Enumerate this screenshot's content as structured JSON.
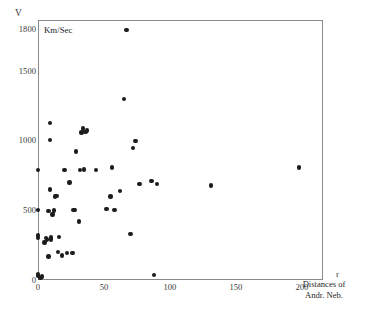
{
  "figure": {
    "unit_label": "Km/Sec",
    "y_axis_symbol": "V",
    "x_axis_symbol": "r",
    "x_caption_line1": "Distances of",
    "x_caption_line2": "Andr. Neb.",
    "frame_color": "#8a8a8a",
    "point_color": "#1c1c1c"
  },
  "chart_data": {
    "type": "scatter",
    "title": "",
    "xlabel": "r  (Distances of Andr. Neb.)",
    "ylabel": "V  (Km/Sec)",
    "xlim": [
      0,
      216
    ],
    "ylim": [
      0,
      1870
    ],
    "grid": false,
    "legend": null,
    "xticks": [
      0,
      50,
      100,
      150,
      200
    ],
    "xtick_labels": [
      "0",
      "50",
      "100",
      "150",
      "200"
    ],
    "yticks": [
      0,
      500,
      1000,
      1500,
      1800
    ],
    "ytick_labels": [
      "0",
      "500",
      "1000",
      "1500",
      "1800"
    ],
    "series": [
      {
        "name": "galaxies",
        "marker": "filled-circle",
        "points": [
          [
            0,
            30
          ],
          [
            0,
            40
          ],
          [
            0,
            300
          ],
          [
            0,
            320
          ],
          [
            0,
            505
          ],
          [
            0,
            790
          ],
          [
            2,
            15
          ],
          [
            3,
            25
          ],
          [
            5,
            270
          ],
          [
            6,
            300
          ],
          [
            7,
            290
          ],
          [
            8,
            170
          ],
          [
            8,
            495
          ],
          [
            9,
            1005
          ],
          [
            9,
            1130
          ],
          [
            9,
            650
          ],
          [
            10,
            305
          ],
          [
            10,
            290
          ],
          [
            11,
            470
          ],
          [
            12,
            500
          ],
          [
            13,
            600
          ],
          [
            14,
            605
          ],
          [
            15,
            200
          ],
          [
            16,
            310
          ],
          [
            18,
            175
          ],
          [
            20,
            790
          ],
          [
            22,
            195
          ],
          [
            24,
            700
          ],
          [
            26,
            195
          ],
          [
            27,
            505
          ],
          [
            28,
            505
          ],
          [
            29,
            925
          ],
          [
            31,
            420
          ],
          [
            32,
            790
          ],
          [
            33,
            1060
          ],
          [
            34,
            1090
          ],
          [
            35,
            795
          ],
          [
            36,
            1065
          ],
          [
            37,
            1075
          ],
          [
            44,
            790
          ],
          [
            52,
            510
          ],
          [
            55,
            600
          ],
          [
            56,
            810
          ],
          [
            58,
            505
          ],
          [
            62,
            640
          ],
          [
            65,
            1300
          ],
          [
            67,
            1800
          ],
          [
            70,
            330
          ],
          [
            72,
            950
          ],
          [
            74,
            1000
          ],
          [
            77,
            690
          ],
          [
            86,
            710
          ],
          [
            88,
            35
          ],
          [
            90,
            690
          ],
          [
            131,
            680
          ],
          [
            198,
            810
          ]
        ]
      }
    ]
  }
}
